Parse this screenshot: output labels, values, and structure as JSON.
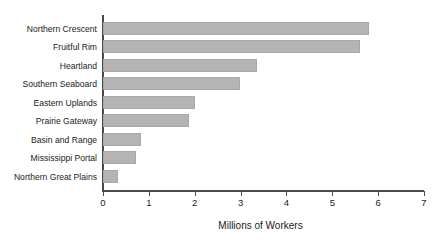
{
  "chart_data": {
    "type": "bar",
    "orientation": "horizontal",
    "title": "",
    "xlabel": "Millions of Workers",
    "ylabel": "",
    "xlim": [
      0,
      7
    ],
    "xticks": [
      0,
      1,
      2,
      3,
      4,
      5,
      6,
      7
    ],
    "xtick_labels": [
      "0",
      "1",
      "2",
      "3",
      "4",
      "5",
      "6",
      "7"
    ],
    "grid": false,
    "legend": null,
    "bar_color": "#b4b4b4",
    "axis_color": "#4a4a4a",
    "categories": [
      "Northern Crescent",
      "Fruitful Rim",
      "Heartland",
      "Southern Seaboard",
      "Eastern Uplands",
      "Prairie Gateway",
      "Basin and Range",
      "Mississippi Portal",
      "Northern Great Plains"
    ],
    "values": [
      5.8,
      5.6,
      3.35,
      2.98,
      2.0,
      1.88,
      0.83,
      0.72,
      0.33
    ]
  }
}
